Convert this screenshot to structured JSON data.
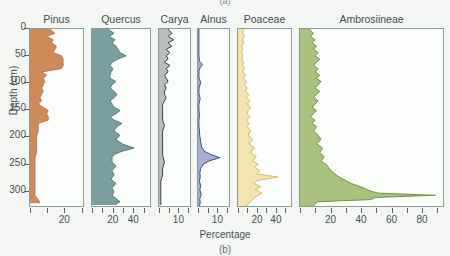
{
  "figure": {
    "caption_top": "(a)",
    "caption_bottom": "(b)",
    "x_axis_title": "Percentage",
    "y_axis_title": "Depth (cm)",
    "background_color": "#f4f6f4"
  },
  "chart_data": {
    "type": "area",
    "title": "",
    "subtitle": "",
    "xlabel": "Percentage",
    "ylabel": "Depth (cm)",
    "orientation": "vertical-depth-profile",
    "grid": false,
    "legend_position": "none",
    "y": [
      0,
      50,
      100,
      150,
      200,
      250,
      300
    ],
    "ylim": [
      0,
      330
    ],
    "y_tick_labels": [
      "0",
      "50",
      "100",
      "150",
      "200",
      "250",
      "300"
    ],
    "panels": [
      {
        "name": "Pinus",
        "color": "#c47b4c",
        "fill": "#cf8a5a",
        "xlim": [
          0,
          32
        ],
        "ticks": [
          0,
          10,
          20,
          30
        ],
        "tick_labels": [
          "",
          "",
          "20",
          ""
        ],
        "labeled_ticks": [
          {
            "value": 20,
            "label": "20"
          }
        ],
        "depths": [
          0,
          8,
          14,
          20,
          26,
          32,
          38,
          44,
          50,
          56,
          62,
          68,
          74,
          80,
          86,
          92,
          98,
          104,
          110,
          116,
          122,
          128,
          134,
          140,
          146,
          152,
          158,
          164,
          170,
          176,
          182,
          190,
          200,
          210,
          220,
          230,
          240,
          250,
          260,
          270,
          280,
          290,
          300,
          310,
          318,
          325
        ],
        "values": [
          12,
          15,
          10,
          14,
          13,
          16,
          15,
          14,
          19,
          20,
          20,
          20,
          19,
          7,
          10,
          8,
          9,
          8,
          7,
          8,
          7,
          6,
          7,
          5,
          8,
          11,
          10,
          11,
          11,
          5,
          5,
          5,
          4,
          4,
          4,
          4,
          3,
          3,
          3,
          3,
          3,
          3,
          3,
          3,
          5,
          6
        ]
      },
      {
        "name": "Quercus",
        "color": "#537d80",
        "fill": "#7b9fa0",
        "xlim": [
          0,
          58
        ],
        "ticks": [
          0,
          10,
          20,
          30,
          40,
          50
        ],
        "tick_labels": [
          "",
          "",
          "20",
          "",
          "40",
          ""
        ],
        "labeled_ticks": [
          {
            "value": 20,
            "label": "20"
          },
          {
            "value": 40,
            "label": "40"
          }
        ],
        "depths": [
          0,
          8,
          14,
          20,
          26,
          32,
          38,
          44,
          50,
          56,
          62,
          68,
          74,
          80,
          86,
          92,
          98,
          104,
          110,
          116,
          122,
          128,
          134,
          140,
          146,
          152,
          158,
          164,
          170,
          176,
          182,
          190,
          198,
          206,
          214,
          222,
          228,
          234,
          240,
          248,
          256,
          264,
          272,
          280,
          288,
          296,
          304,
          310,
          316,
          322,
          328
        ],
        "values": [
          16,
          22,
          17,
          23,
          20,
          24,
          26,
          28,
          34,
          26,
          20,
          18,
          21,
          19,
          18,
          18,
          24,
          20,
          18,
          22,
          25,
          22,
          18,
          20,
          22,
          28,
          24,
          18,
          22,
          30,
          25,
          22,
          28,
          24,
          30,
          42,
          30,
          22,
          20,
          20,
          24,
          20,
          22,
          19,
          24,
          20,
          22,
          20,
          24,
          28,
          23
        ]
      },
      {
        "name": "Carya",
        "color": "#3a3f44",
        "fill": "#b8bdc0",
        "xlim": [
          0,
          17
        ],
        "ticks": [
          0,
          5,
          10,
          15
        ],
        "tick_labels": [
          "",
          "",
          "10",
          ""
        ],
        "labeled_ticks": [
          {
            "value": 10,
            "label": "10"
          }
        ],
        "depths": [
          0,
          8,
          14,
          20,
          26,
          32,
          38,
          44,
          50,
          56,
          62,
          68,
          74,
          80,
          86,
          92,
          98,
          104,
          110,
          116,
          122,
          128,
          134,
          140,
          146,
          152,
          160,
          170,
          180,
          190,
          200,
          212,
          224,
          236,
          248,
          260,
          272,
          284,
          296,
          308,
          318,
          328
        ],
        "values": [
          5,
          7,
          5,
          8,
          5,
          7,
          4,
          6,
          4,
          5,
          3,
          6,
          4,
          5,
          3,
          4,
          5,
          3,
          4,
          3,
          3,
          4,
          3,
          2,
          2,
          2,
          2,
          2,
          3,
          2,
          2,
          2,
          2,
          2,
          3,
          2,
          2,
          1,
          1,
          1,
          1,
          1
        ]
      },
      {
        "name": "Alnus",
        "color": "#3c4f8c",
        "fill": "#a7aed4",
        "xlim": [
          0,
          17
        ],
        "ticks": [
          0,
          5,
          10,
          15
        ],
        "tick_labels": [
          "",
          "",
          "10",
          ""
        ],
        "labeled_ticks": [
          {
            "value": 10,
            "label": "10"
          }
        ],
        "depths": [
          0,
          10,
          20,
          30,
          40,
          50,
          60,
          66,
          72,
          78,
          90,
          100,
          110,
          120,
          130,
          140,
          150,
          160,
          170,
          180,
          190,
          200,
          210,
          220,
          228,
          234,
          240,
          246,
          252,
          260,
          268,
          276,
          284,
          292,
          300,
          308,
          316,
          324,
          330
        ],
        "values": [
          0.5,
          0.5,
          0.5,
          0.5,
          0.5,
          0.5,
          0.8,
          2.5,
          1.2,
          0.5,
          0.5,
          1.5,
          0.5,
          0.5,
          1.2,
          0.5,
          0.5,
          0.8,
          0.5,
          0.5,
          0.8,
          1.0,
          1.5,
          2.0,
          3.5,
          7.0,
          12.0,
          6.0,
          3.0,
          1.5,
          1.0,
          1.2,
          0.8,
          1.5,
          1.0,
          1.8,
          1.0,
          1.2,
          0.8
        ]
      },
      {
        "name": "Poaceae",
        "color": "#d8b760",
        "fill": "#f5e3b0",
        "xlim": [
          0,
          58
        ],
        "ticks": [
          0,
          10,
          20,
          30,
          40,
          50
        ],
        "tick_labels": [
          "",
          "",
          "20",
          "",
          "40",
          ""
        ],
        "labeled_ticks": [
          {
            "value": 20,
            "label": "20"
          },
          {
            "value": 40,
            "label": "40"
          }
        ],
        "depths": [
          0,
          8,
          14,
          20,
          26,
          32,
          38,
          44,
          50,
          56,
          62,
          68,
          74,
          80,
          86,
          92,
          98,
          104,
          110,
          116,
          122,
          128,
          134,
          140,
          146,
          152,
          158,
          164,
          170,
          176,
          182,
          190,
          198,
          206,
          214,
          222,
          230,
          238,
          246,
          252,
          258,
          264,
          270,
          276,
          282,
          288,
          294,
          300,
          306,
          312,
          318,
          324,
          330
        ],
        "values": [
          6,
          5,
          7,
          5,
          6,
          4,
          5,
          4,
          5,
          4,
          6,
          5,
          7,
          5,
          8,
          6,
          9,
          7,
          10,
          8,
          12,
          9,
          13,
          10,
          14,
          11,
          10,
          13,
          9,
          12,
          10,
          14,
          11,
          16,
          12,
          18,
          14,
          20,
          16,
          22,
          18,
          24,
          20,
          44,
          22,
          17,
          25,
          19,
          26,
          20,
          16,
          12,
          10
        ]
      },
      {
        "name": "Ambrosiineae",
        "color": "#6e9440",
        "fill": "#a9c27e",
        "xlim": [
          0,
          95
        ],
        "ticks": [
          0,
          10,
          20,
          30,
          40,
          50,
          60,
          70,
          80,
          90
        ],
        "tick_labels": [
          "",
          "",
          "20",
          "",
          "40",
          "",
          "60",
          "",
          "80",
          ""
        ],
        "labeled_ticks": [
          {
            "value": 20,
            "label": "20"
          },
          {
            "value": 40,
            "label": "40"
          },
          {
            "value": 60,
            "label": "60"
          },
          {
            "value": 80,
            "label": "80"
          }
        ],
        "depths": [
          0,
          8,
          14,
          20,
          26,
          32,
          38,
          44,
          50,
          56,
          62,
          68,
          74,
          80,
          86,
          92,
          98,
          104,
          110,
          116,
          122,
          128,
          134,
          140,
          146,
          152,
          158,
          164,
          170,
          176,
          182,
          190,
          198,
          206,
          214,
          222,
          230,
          238,
          246,
          254,
          262,
          270,
          276,
          282,
          288,
          292,
          296,
          300,
          303,
          306,
          310,
          314,
          318,
          322,
          326,
          330
        ],
        "values": [
          6,
          9,
          7,
          10,
          8,
          11,
          9,
          12,
          10,
          13,
          11,
          9,
          12,
          10,
          13,
          11,
          14,
          12,
          10,
          13,
          11,
          9,
          12,
          10,
          8,
          11,
          9,
          7,
          10,
          8,
          11,
          9,
          12,
          14,
          11,
          15,
          13,
          16,
          14,
          18,
          20,
          23,
          26,
          30,
          34,
          38,
          42,
          45,
          48,
          52,
          90,
          50,
          47,
          12,
          10,
          9
        ]
      }
    ]
  },
  "panel_geometry": [
    {
      "left": 29,
      "width": 55
    },
    {
      "left": 91,
      "width": 60
    },
    {
      "left": 158,
      "width": 33
    },
    {
      "left": 197,
      "width": 33
    },
    {
      "left": 237,
      "width": 55
    },
    {
      "left": 299,
      "width": 145
    }
  ]
}
